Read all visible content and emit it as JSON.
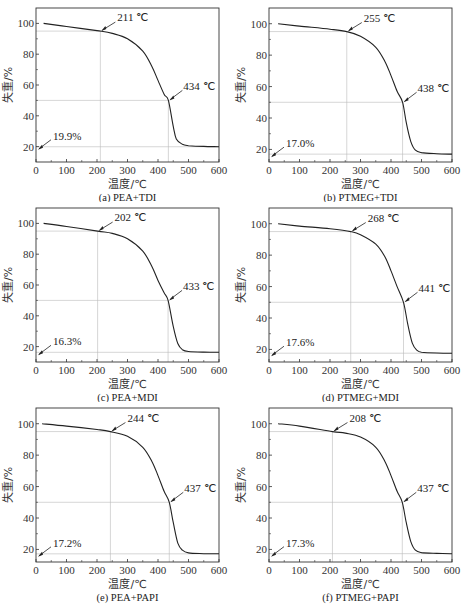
{
  "chart_data": [
    {
      "type": "line",
      "id": "a",
      "caption": "(a) PEA+TDI",
      "xlabel": "温度/℃",
      "ylabel": "失重/%",
      "xlim": [
        0,
        600
      ],
      "ylim": [
        10,
        110
      ],
      "xticks": [
        0,
        100,
        200,
        300,
        400,
        500,
        600
      ],
      "yticks": [
        20,
        40,
        60,
        80,
        100
      ],
      "grid": false,
      "annotations": [
        {
          "text": "211 ℃",
          "x": 211,
          "y": 95
        },
        {
          "text": "434 ℃",
          "x": 434,
          "y": 50
        },
        {
          "text": "19.9%",
          "x": 0,
          "y": 19.9
        }
      ],
      "reference_lines": {
        "t5": 211,
        "t50": 434,
        "y95": 95,
        "y50": 50,
        "residue": 19.9
      },
      "series": [
        {
          "name": "PEA+TDI",
          "x": [
            25,
            100,
            200,
            250,
            300,
            350,
            380,
            400,
            420,
            434,
            450,
            460,
            480,
            500,
            550,
            600
          ],
          "y": [
            100,
            98,
            95.3,
            93.5,
            90,
            82,
            72,
            63,
            54,
            50,
            33,
            25,
            21.5,
            20.6,
            20.1,
            19.9
          ]
        }
      ]
    },
    {
      "type": "line",
      "id": "b",
      "caption": "(b) PTMEG+TDI",
      "xlabel": "温度/℃",
      "ylabel": "失重/%",
      "xlim": [
        0,
        600
      ],
      "ylim": [
        12,
        110
      ],
      "xticks": [
        0,
        100,
        200,
        300,
        400,
        500,
        600
      ],
      "yticks": [
        20,
        40,
        60,
        80,
        100
      ],
      "grid": false,
      "annotations": [
        {
          "text": "255 ℃",
          "x": 255,
          "y": 95
        },
        {
          "text": "438 ℃",
          "x": 438,
          "y": 50
        },
        {
          "text": "17.0%",
          "x": 0,
          "y": 17.0
        }
      ],
      "reference_lines": {
        "t5": 255,
        "t50": 438,
        "y95": 95,
        "y50": 50,
        "residue": 17.0
      },
      "series": [
        {
          "name": "PTMEG+TDI",
          "x": [
            30,
            100,
            200,
            255,
            300,
            350,
            380,
            400,
            420,
            438,
            450,
            465,
            480,
            500,
            550,
            600
          ],
          "y": [
            100,
            98.5,
            96.5,
            95,
            92,
            85,
            76,
            67,
            57,
            50,
            37,
            25,
            19.5,
            18,
            17.3,
            17.0
          ]
        }
      ]
    },
    {
      "type": "line",
      "id": "c",
      "caption": "(c) PEA+MDI",
      "xlabel": "温度/℃",
      "ylabel": "失重/%",
      "xlim": [
        0,
        600
      ],
      "ylim": [
        10,
        110
      ],
      "xticks": [
        0,
        100,
        200,
        300,
        400,
        500,
        600
      ],
      "yticks": [
        20,
        40,
        60,
        80,
        100
      ],
      "grid": false,
      "annotations": [
        {
          "text": "202 ℃",
          "x": 202,
          "y": 95
        },
        {
          "text": "433 ℃",
          "x": 433,
          "y": 50
        },
        {
          "text": "16.3%",
          "x": 0,
          "y": 16.3
        }
      ],
      "reference_lines": {
        "t5": 202,
        "t50": 433,
        "y95": 95,
        "y50": 50,
        "residue": 16.3
      },
      "series": [
        {
          "name": "PEA+MDI",
          "x": [
            25,
            100,
            202,
            250,
            300,
            350,
            380,
            400,
            420,
            433,
            450,
            465,
            480,
            500,
            550,
            600
          ],
          "y": [
            100,
            98,
            95,
            93.5,
            90,
            82,
            72,
            63,
            55,
            50,
            33,
            22,
            18,
            16.8,
            16.4,
            16.3
          ]
        }
      ]
    },
    {
      "type": "line",
      "id": "d",
      "caption": "(d) PTMEG+MDI",
      "xlabel": "温度/℃",
      "ylabel": "失重/%",
      "xlim": [
        0,
        600
      ],
      "ylim": [
        12,
        110
      ],
      "xticks": [
        0,
        100,
        200,
        300,
        400,
        500,
        600
      ],
      "yticks": [
        20,
        40,
        60,
        80,
        100
      ],
      "grid": false,
      "annotations": [
        {
          "text": "268 ℃",
          "x": 268,
          "y": 95
        },
        {
          "text": "441 ℃",
          "x": 441,
          "y": 50
        },
        {
          "text": "17.6%",
          "x": 0,
          "y": 17.6
        }
      ],
      "reference_lines": {
        "t5": 268,
        "t50": 441,
        "y95": 95,
        "y50": 50,
        "residue": 17.6
      },
      "series": [
        {
          "name": "PTMEG+MDI",
          "x": [
            30,
            100,
            200,
            268,
            300,
            350,
            380,
            400,
            420,
            441,
            455,
            470,
            485,
            500,
            550,
            600
          ],
          "y": [
            100,
            98.5,
            96.8,
            95,
            93,
            87,
            79,
            70,
            60,
            50,
            36,
            24,
            19.5,
            18.2,
            17.7,
            17.6
          ]
        }
      ]
    },
    {
      "type": "line",
      "id": "e",
      "caption": "(e) PEA+PAPI",
      "xlabel": "温度/℃",
      "ylabel": "失重/%",
      "xlim": [
        0,
        600
      ],
      "ylim": [
        12,
        110
      ],
      "xticks": [
        0,
        100,
        200,
        300,
        400,
        500,
        600
      ],
      "yticks": [
        20,
        40,
        60,
        80,
        100
      ],
      "grid": false,
      "annotations": [
        {
          "text": "244 ℃",
          "x": 244,
          "y": 95
        },
        {
          "text": "437 ℃",
          "x": 437,
          "y": 50
        },
        {
          "text": "17.2%",
          "x": 0,
          "y": 17.2
        }
      ],
      "reference_lines": {
        "t5": 244,
        "t50": 437,
        "y95": 95,
        "y50": 50,
        "residue": 17.2
      },
      "series": [
        {
          "name": "PEA+PAPI",
          "x": [
            20,
            100,
            200,
            244,
            300,
            350,
            380,
            400,
            420,
            437,
            450,
            465,
            480,
            500,
            550,
            600
          ],
          "y": [
            100,
            98.5,
            96.3,
            95,
            92,
            85,
            76,
            67,
            57,
            50,
            37,
            24,
            19.5,
            17.8,
            17.3,
            17.2
          ]
        }
      ]
    },
    {
      "type": "line",
      "id": "f",
      "caption": "(f) PTMEG+PAPI",
      "xlabel": "温度/℃",
      "ylabel": "失重/%",
      "xlim": [
        0,
        600
      ],
      "ylim": [
        12,
        110
      ],
      "xticks": [
        0,
        100,
        200,
        300,
        400,
        500,
        600
      ],
      "yticks": [
        20,
        40,
        60,
        80,
        100
      ],
      "grid": false,
      "annotations": [
        {
          "text": "208 ℃",
          "x": 208,
          "y": 95
        },
        {
          "text": "437 ℃",
          "x": 437,
          "y": 50
        },
        {
          "text": "17.3%",
          "x": 0,
          "y": 17.3
        }
      ],
      "reference_lines": {
        "t5": 208,
        "t50": 437,
        "y95": 95,
        "y50": 50,
        "residue": 17.3
      },
      "series": [
        {
          "name": "PTMEG+PAPI",
          "x": [
            30,
            100,
            208,
            250,
            300,
            350,
            380,
            400,
            420,
            437,
            450,
            465,
            480,
            500,
            550,
            600
          ],
          "y": [
            100,
            98.5,
            95,
            94,
            91.5,
            85,
            76,
            67,
            57,
            50,
            37,
            25,
            19.5,
            18,
            17.5,
            17.3
          ]
        }
      ]
    }
  ]
}
